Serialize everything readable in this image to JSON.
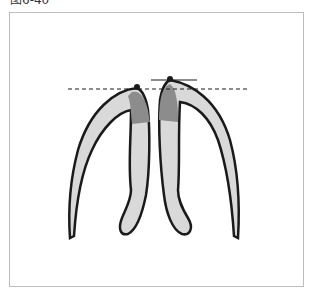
{
  "figure": {
    "caption": "图6-40",
    "colors": {
      "outline": "#1a1a1a",
      "light_fill": "#d9d9d9",
      "dark_fill": "#8c8c8c",
      "frame": "#bdbdbd"
    },
    "elements": [
      "left-tooth",
      "right-tooth",
      "dashed-reference-line",
      "solid-reference-line",
      "contact-point-left",
      "contact-point-right"
    ]
  }
}
